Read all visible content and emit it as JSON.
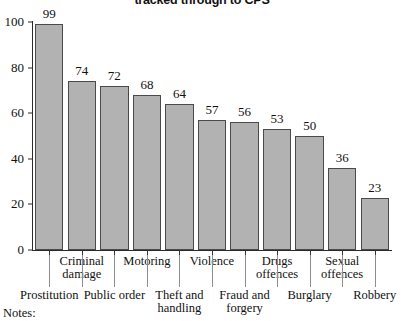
{
  "title": "tracked through to CPS",
  "notes_label": "Notes:",
  "colors": {
    "bar_fill": "#b2b2b2",
    "bar_stroke": "#4a4a4a",
    "axis": "#2a2a2a",
    "text": "#111111"
  },
  "chart_data": {
    "type": "bar",
    "title": "tracked through to CPS",
    "xlabel": "",
    "ylabel": "",
    "ylim": [
      0,
      100
    ],
    "yticks": [
      0,
      20,
      40,
      60,
      80,
      100
    ],
    "grid": false,
    "legend": null,
    "categories": [
      "Prostitution",
      "Criminal damage",
      "Public order",
      "Motoring",
      "Theft and handling",
      "Violence",
      "Fraud and forgery",
      "Drugs offences",
      "Burglary",
      "Sexual offences",
      "Robbery"
    ],
    "values": [
      99,
      74,
      72,
      68,
      64,
      57,
      56,
      53,
      50,
      36,
      23
    ],
    "label_rows": [
      "bottom",
      "top",
      "bottom",
      "top",
      "bottom",
      "top",
      "bottom",
      "top",
      "bottom",
      "top",
      "bottom"
    ]
  }
}
